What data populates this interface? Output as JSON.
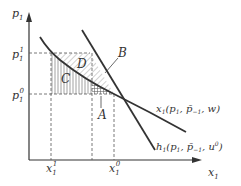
{
  "diagram": {
    "type": "economics-demand-diagram",
    "axes": {
      "y_label": "p",
      "y_label_sub": "1",
      "x_label": "x",
      "x_label_sub": "1"
    },
    "price_levels": [
      {
        "name": "p1-superscript-1",
        "base": "p",
        "sub": "1",
        "sup": "1"
      },
      {
        "name": "p1-superscript-0",
        "base": "p",
        "sub": "1",
        "sup": "0"
      }
    ],
    "quantity_levels": [
      {
        "name": "x1-superscript-1",
        "base": "x",
        "sub": "1",
        "sup": "1"
      },
      {
        "name": "x1-superscript-0",
        "base": "x",
        "sub": "1",
        "sup": "0"
      }
    ],
    "regions": {
      "A": "A",
      "B": "B",
      "C": "C",
      "D": "D"
    },
    "curves": {
      "marshallian": {
        "label_fn": "x",
        "label_sub": "1",
        "label_args": "(p",
        "label_args_sub": "1",
        "label_rest": ", p̄",
        "label_rest_sub": "−1",
        "label_end": ", w)"
      },
      "hicksian": {
        "label_fn": "h",
        "label_sub": "1",
        "label_args": "(p",
        "label_args_sub": "1",
        "label_rest": ", p̄",
        "label_rest_sub": "−1",
        "label_end": ", u",
        "label_end_sup": "0",
        "label_close": ")"
      }
    },
    "colors": {
      "ink": "#333333",
      "dashed": "#555555",
      "hatch": "#666666"
    }
  }
}
